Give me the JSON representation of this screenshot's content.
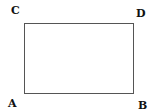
{
  "diagram": {
    "shape": "rectangle",
    "stroke_color": "#555555",
    "vertices": {
      "top_left": "C",
      "top_right": "D",
      "bottom_left": "A",
      "bottom_right": "B"
    }
  }
}
